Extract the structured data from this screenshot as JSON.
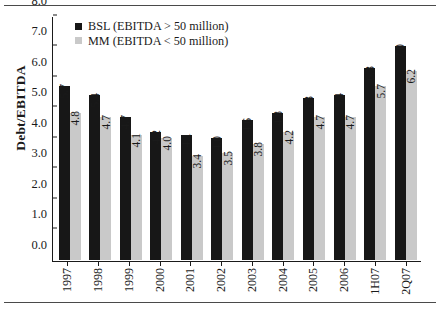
{
  "chart_data": {
    "type": "bar",
    "title": "",
    "xlabel": "",
    "ylabel": "Debt/EBITDA",
    "ylim": [
      0.0,
      8.0
    ],
    "ytick_labels": [
      "0.0",
      "1.0",
      "2.0",
      "3.0",
      "4.0",
      "5.0",
      "6.0",
      "7.0",
      "8.0"
    ],
    "ytick_values": [
      0,
      1,
      2,
      3,
      4,
      5,
      6,
      7,
      8
    ],
    "grid": false,
    "legend_position": "top-left",
    "categories": [
      "1997",
      "1998",
      "1999",
      "2000",
      "2001",
      "2002",
      "2003",
      "2004",
      "2005",
      "2006",
      "1H07",
      "2Q07"
    ],
    "series": [
      {
        "name": "BSL (EBITDA > 50 million)",
        "color": "#171717",
        "values": [
          5.7,
          5.4,
          4.7,
          4.2,
          4.1,
          4.0,
          4.6,
          4.8,
          5.3,
          5.4,
          6.3,
          7.0
        ],
        "labels": [
          "5.7",
          "5.4",
          "4.7",
          "4.2",
          "4.1",
          "4.0",
          "4.6",
          "4.8",
          "5.3",
          "5.4",
          "6.3",
          "7.0"
        ]
      },
      {
        "name": "MM (EBITDA < 50 million)",
        "color": "#c9c9c9",
        "values": [
          4.8,
          4.7,
          4.1,
          4.0,
          3.4,
          3.5,
          3.8,
          4.2,
          4.7,
          4.7,
          5.7,
          6.2
        ],
        "labels": [
          "4.8",
          "4.7",
          "4.1",
          "4.0",
          "3.4",
          "3.5",
          "3.8",
          "4.2",
          "4.7",
          "4.7",
          "5.7",
          "6.2"
        ]
      }
    ]
  },
  "legend": {
    "items": [
      {
        "label": "BSL (EBITDA > 50 million)",
        "color": "#171717"
      },
      {
        "label": "MM (EBITDA < 50 million)",
        "color": "#c9c9c9"
      }
    ]
  }
}
